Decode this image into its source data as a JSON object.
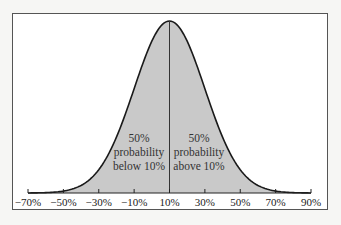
{
  "chart_data": {
    "type": "area",
    "title": "",
    "xlabel": "",
    "ylabel": "",
    "distribution": "normal",
    "mean": 10,
    "std": 20,
    "x_ticks": [
      -70,
      -50,
      -30,
      -10,
      10,
      30,
      50,
      70,
      90
    ],
    "x_tick_labels": [
      "−70%",
      "−50%",
      "−30%",
      "−10%",
      "10%",
      "30%",
      "50%",
      "70%",
      "90%"
    ],
    "xlim": [
      -70,
      90
    ],
    "grid": false,
    "legend": null,
    "fill_color": "#c9c9c9",
    "line_color": "#1a1a1a",
    "divider_x": 10,
    "annotations": [
      {
        "lines": [
          "50%",
          "probability",
          "below 10%"
        ],
        "side": "left"
      },
      {
        "lines": [
          "50%",
          "probability",
          "above 10%"
        ],
        "side": "right"
      }
    ]
  }
}
